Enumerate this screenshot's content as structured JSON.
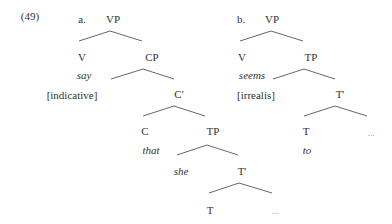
{
  "example_number": "(49)",
  "tree_a": {
    "label": "a.",
    "root": "VP",
    "v": "V",
    "v_word": "say",
    "v_feature": "[indicative]",
    "cp": "CP",
    "c_bar": "C'",
    "c": "C",
    "c_word": "that",
    "tp": "TP",
    "spec": "she",
    "t_bar": "T'",
    "t": "T",
    "ellipsis": "..."
  },
  "tree_b": {
    "label": "b.",
    "root": "VP",
    "v": "V",
    "v_word": "seems",
    "v_feature": "[irrealis]",
    "tp": "TP",
    "t_bar": "T'",
    "t": "T",
    "t_word": "to",
    "ellipsis": "..."
  }
}
